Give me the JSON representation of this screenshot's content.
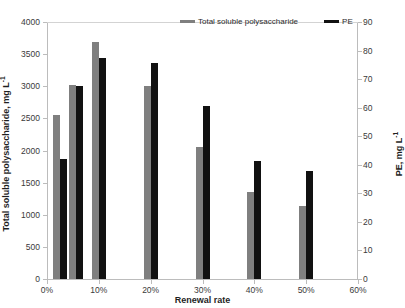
{
  "chart_data": {
    "type": "bar",
    "title": "",
    "xlabel": "Renewal rate",
    "ylabel": "Total soluble polysaccharide, mg L⁻¹",
    "y2label": "PE, mg L⁻¹",
    "categories": [
      "0%",
      "5%",
      "10%",
      "20%",
      "30%",
      "40%",
      "50%"
    ],
    "x_positions_pct": [
      2.5,
      5.5,
      10,
      20,
      30,
      40,
      50
    ],
    "xlim": [
      0,
      60
    ],
    "xticks": [
      "0%",
      "10%",
      "20%",
      "30%",
      "40%",
      "50%",
      "60%"
    ],
    "xtick_values": [
      0,
      10,
      20,
      30,
      40,
      50,
      60
    ],
    "ylim": [
      0,
      4000
    ],
    "yticks": [
      "0",
      "500",
      "1000",
      "1500",
      "2000",
      "2500",
      "3000",
      "3500",
      "4000"
    ],
    "ytick_values": [
      0,
      500,
      1000,
      1500,
      2000,
      2500,
      3000,
      3500,
      4000
    ],
    "y2lim": [
      0,
      90
    ],
    "y2ticks": [
      "0",
      "10",
      "20",
      "30",
      "40",
      "50",
      "60",
      "70",
      "80",
      "90"
    ],
    "y2tick_values": [
      0,
      10,
      20,
      30,
      40,
      50,
      60,
      70,
      80,
      90
    ],
    "grid": false,
    "legend_position": "top-right",
    "series": [
      {
        "name": "Total soluble polysaccharide",
        "axis": "left",
        "color": "#7f7f7f",
        "values": [
          2550,
          3020,
          3690,
          3010,
          2060,
          1350,
          1140
        ]
      },
      {
        "name": "PE",
        "axis": "right",
        "color": "#111111",
        "values": [
          42,
          67.5,
          77.5,
          75.5,
          60.5,
          41.5,
          38
        ]
      }
    ]
  },
  "legend": {
    "entries": [
      {
        "label": "Total soluble polysaccharide",
        "color": "#7f7f7f"
      },
      {
        "label": "PE",
        "color": "#111111"
      }
    ]
  },
  "axis_titles": {
    "y_left": "Total soluble polysaccharide, mg L",
    "y_left_sup": "-1",
    "y_right": "PE, mg L",
    "y_right_sup": "-1",
    "x": "Renewal rate"
  }
}
